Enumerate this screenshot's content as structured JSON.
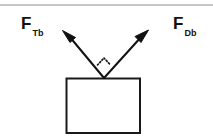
{
  "figure": {
    "type": "free-body-force-diagram",
    "background_color": "#ffffff",
    "stroke_color": "#111111",
    "top_rule_color": "#8d8d8d",
    "labels": {
      "left": {
        "symbol": "F",
        "subscript": "Tb",
        "full": "F_Tb"
      },
      "right": {
        "symbol": "F",
        "subscript": "Db",
        "full": "F_Db"
      }
    },
    "body": {
      "name": "block",
      "shape": "rectangle",
      "x": 66,
      "y": 78,
      "width": 74,
      "height": 55
    },
    "vectors": [
      {
        "name": "force-vector-left",
        "label": "F_Tb",
        "origin_x": 104,
        "origin_y": 78,
        "tip_x": 64,
        "tip_y": 31
      },
      {
        "name": "force-vector-right",
        "label": "F_Db",
        "origin_x": 104,
        "origin_y": 78,
        "tip_x": 147,
        "tip_y": 31
      }
    ],
    "angle_marker": {
      "name": "right-angle-marker",
      "style": "dotted",
      "vertex_x": 104,
      "vertex_y": 78
    },
    "top_rule": {
      "y": 5
    }
  }
}
